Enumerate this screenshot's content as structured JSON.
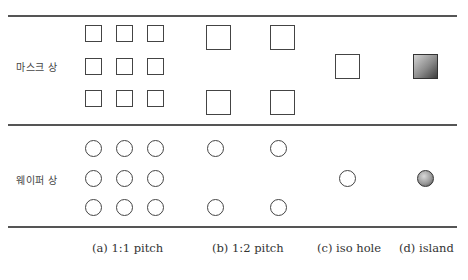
{
  "figure": {
    "rows": [
      {
        "label": "마스크 상",
        "shape": "square"
      },
      {
        "label": "웨이퍼 상",
        "shape": "circle"
      }
    ],
    "columns": [
      {
        "label": "(a) 1:1 pitch"
      },
      {
        "label": "(b) 1:2 pitch"
      },
      {
        "label": "(c) iso hole"
      },
      {
        "label": "(d) island"
      }
    ],
    "colors": {
      "stroke": "#444444",
      "rule": "#555555",
      "island_fill_light": "#d4d4d4",
      "island_fill_dark": "#3e3e3e"
    },
    "caption": ""
  }
}
